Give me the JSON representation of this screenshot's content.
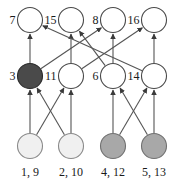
{
  "diagram": {
    "type": "layered-directed-graph",
    "background_color": "#ffffff",
    "edge_color": "#555555",
    "label_color": "#1a1a1a",
    "rows": 3,
    "columns": 4,
    "node_radius": 12.5,
    "fills": {
      "white": "#ffffff",
      "dark_gray": "#4a4a4a",
      "medium_gray": "#a8a8a8",
      "very_light_gray": "#f0f0f0"
    },
    "nodes": [
      {
        "id": "n7",
        "label": "7",
        "label_pos": "left",
        "cx": 30,
        "cy": 20,
        "fill": "white",
        "stroke": "#4a4a4a"
      },
      {
        "id": "n15",
        "label": "15",
        "label_pos": "left",
        "cx": 71,
        "cy": 20,
        "fill": "white",
        "stroke": "#4a4a4a"
      },
      {
        "id": "n8",
        "label": "8",
        "label_pos": "left",
        "cx": 113,
        "cy": 20,
        "fill": "white",
        "stroke": "#4a4a4a"
      },
      {
        "id": "n16",
        "label": "16",
        "label_pos": "left",
        "cx": 154,
        "cy": 20,
        "fill": "white",
        "stroke": "#4a4a4a"
      },
      {
        "id": "n3",
        "label": "3",
        "label_pos": "left",
        "cx": 30,
        "cy": 76,
        "fill": "dark_gray",
        "stroke": "#2a2a2a"
      },
      {
        "id": "n11",
        "label": "11",
        "label_pos": "left",
        "cx": 71,
        "cy": 76,
        "fill": "white",
        "stroke": "#4a4a4a"
      },
      {
        "id": "n6",
        "label": "6",
        "label_pos": "left",
        "cx": 113,
        "cy": 76,
        "fill": "white",
        "stroke": "#4a4a4a"
      },
      {
        "id": "n14",
        "label": "14",
        "label_pos": "left",
        "cx": 154,
        "cy": 76,
        "fill": "white",
        "stroke": "#4a4a4a"
      },
      {
        "id": "n1",
        "label": "1, 9",
        "label_pos": "bottom",
        "cx": 30,
        "cy": 146,
        "fill": "very_light_gray",
        "stroke": "#8a8a8a"
      },
      {
        "id": "n2",
        "label": "2, 10",
        "label_pos": "bottom",
        "cx": 71,
        "cy": 146,
        "fill": "very_light_gray",
        "stroke": "#8a8a8a"
      },
      {
        "id": "n4",
        "label": "4, 12",
        "label_pos": "bottom",
        "cx": 113,
        "cy": 146,
        "fill": "medium_gray",
        "stroke": "#707070"
      },
      {
        "id": "n5",
        "label": "5, 13",
        "label_pos": "bottom",
        "cx": 154,
        "cy": 146,
        "fill": "medium_gray",
        "stroke": "#707070"
      }
    ],
    "edges": [
      {
        "from": "n1",
        "to": "n3",
        "kind": "vertical"
      },
      {
        "from": "n1",
        "to": "n11",
        "kind": "diagonal"
      },
      {
        "from": "n2",
        "to": "n3",
        "kind": "diagonal"
      },
      {
        "from": "n2",
        "to": "n11",
        "kind": "vertical"
      },
      {
        "from": "n4",
        "to": "n6",
        "kind": "vertical"
      },
      {
        "from": "n4",
        "to": "n14",
        "kind": "diagonal"
      },
      {
        "from": "n5",
        "to": "n6",
        "kind": "diagonal"
      },
      {
        "from": "n5",
        "to": "n14",
        "kind": "vertical"
      },
      {
        "from": "n3",
        "to": "n7",
        "kind": "vertical"
      },
      {
        "from": "n3",
        "to": "n8",
        "kind": "diagonal-long"
      },
      {
        "from": "n11",
        "to": "n15",
        "kind": "vertical"
      },
      {
        "from": "n11",
        "to": "n16",
        "kind": "diagonal-long"
      },
      {
        "from": "n6",
        "to": "n8",
        "kind": "vertical"
      },
      {
        "from": "n6",
        "to": "n15",
        "kind": "diagonal-long"
      },
      {
        "from": "n14",
        "to": "n16",
        "kind": "vertical"
      },
      {
        "from": "n14",
        "to": "n7",
        "kind": "diagonal-long"
      }
    ]
  }
}
